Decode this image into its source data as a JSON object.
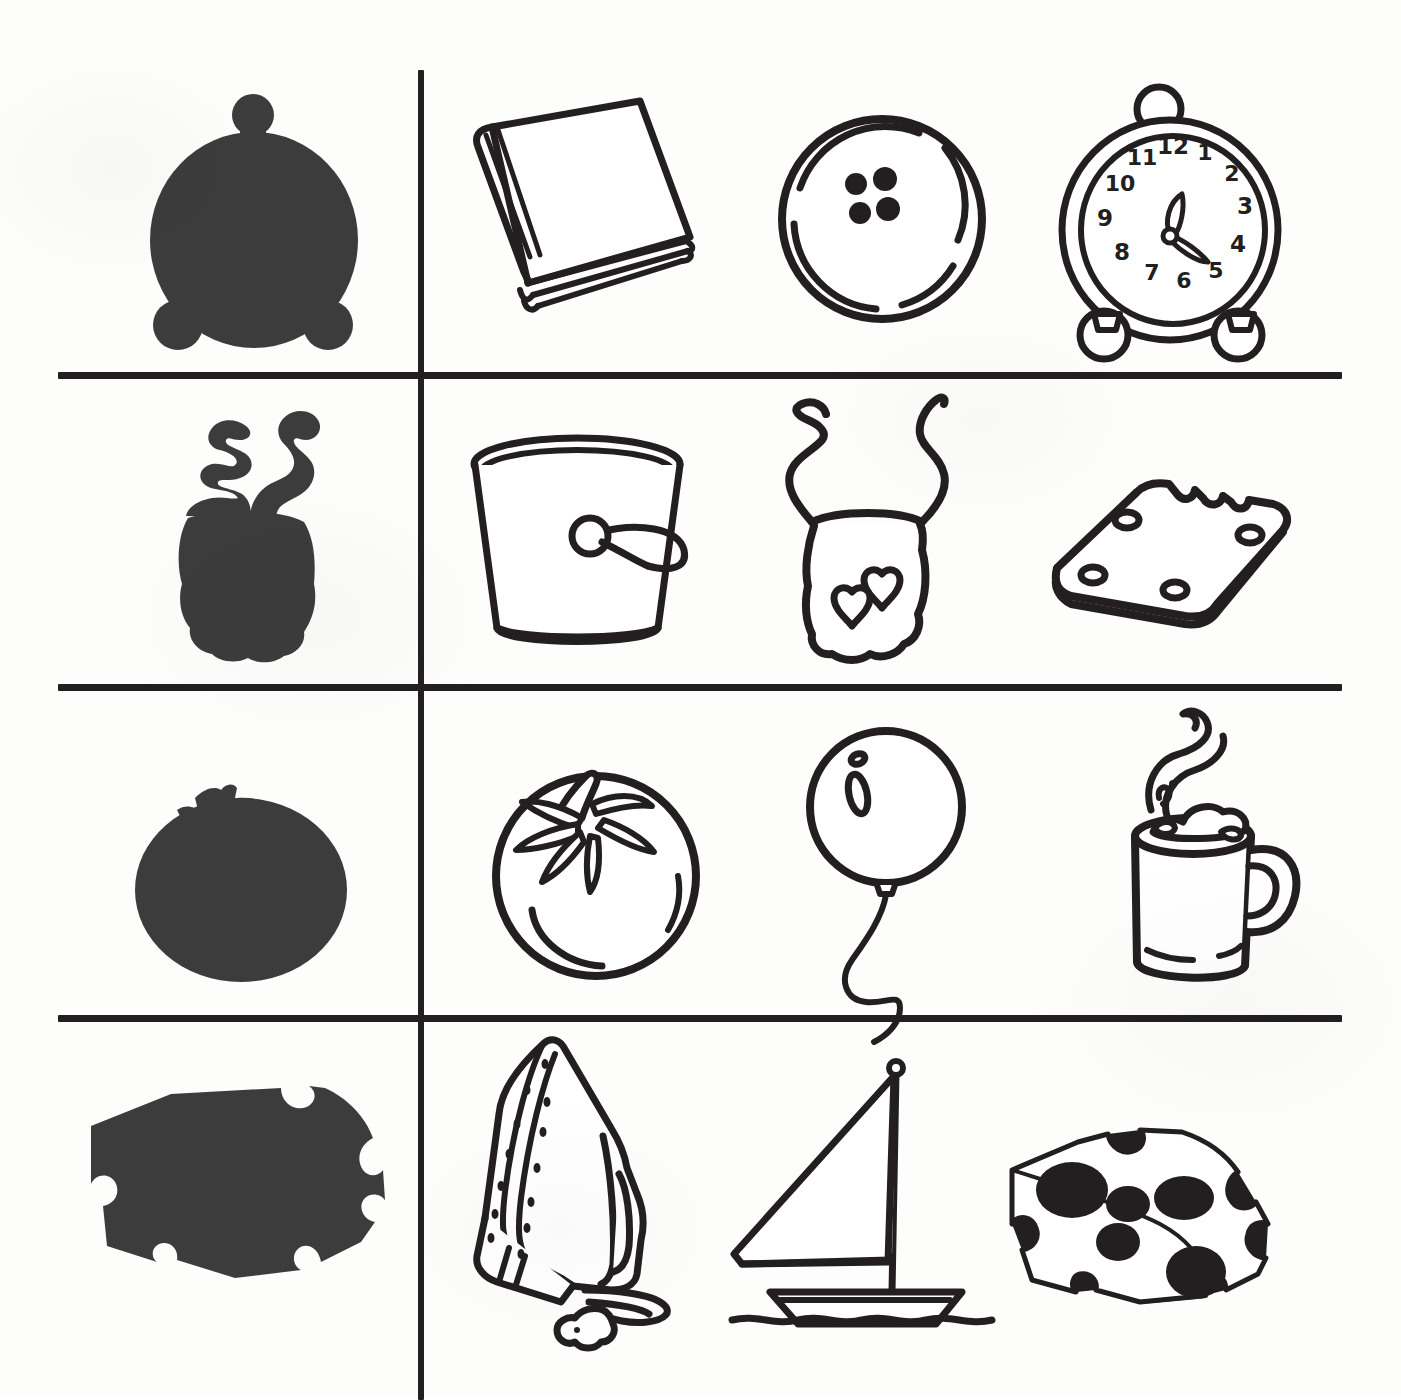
{
  "worksheet": {
    "title": "Shadow Matching Worksheet",
    "instruction": "",
    "layout": {
      "columns": 4,
      "rows": 4,
      "shadow_column_index": 0,
      "divider_color": "#231f20",
      "shadow_fill": "#3c3c3c",
      "outline_color": "#231f20",
      "background": "#ffffff"
    },
    "rows": [
      {
        "row_label": "row-1",
        "shadow": {
          "name": "alarm-clock-shadow",
          "object": "alarm clock"
        },
        "options": [
          {
            "name": "book",
            "label": "book",
            "is_match": false
          },
          {
            "name": "button",
            "label": "button",
            "is_match": false,
            "holes": 4
          },
          {
            "name": "alarm-clock",
            "label": "alarm clock",
            "is_match": true,
            "clock_numerals": [
              "12",
              "1",
              "2",
              "3",
              "4",
              "5",
              "6",
              "7",
              "8",
              "9",
              "10",
              "11"
            ],
            "hour_hand": "12",
            "minute_hand": "4"
          }
        ]
      },
      {
        "row_label": "row-2",
        "shadow": {
          "name": "bib-shadow",
          "object": "baby bib"
        },
        "options": [
          {
            "name": "bucket",
            "label": "bucket",
            "is_match": false
          },
          {
            "name": "bib",
            "label": "bib",
            "is_match": true,
            "decoration": "two hearts"
          },
          {
            "name": "cracker",
            "label": "cracker",
            "is_match": false,
            "detail": "bite taken out"
          }
        ]
      },
      {
        "row_label": "row-3",
        "shadow": {
          "name": "tomato-shadow",
          "object": "tomato"
        },
        "options": [
          {
            "name": "tomato",
            "label": "tomato",
            "is_match": true
          },
          {
            "name": "balloon",
            "label": "balloon",
            "is_match": false,
            "detail": "curly string"
          },
          {
            "name": "hot-cocoa-mug",
            "label": "mug of cocoa",
            "is_match": false,
            "detail": "steam and marshmallows"
          }
        ]
      },
      {
        "row_label": "row-4",
        "shadow": {
          "name": "cheese-shadow",
          "object": "cheese wedge"
        },
        "options": [
          {
            "name": "iron",
            "label": "iron",
            "is_match": false,
            "detail": "cord and plug"
          },
          {
            "name": "sailboat",
            "label": "sailboat",
            "is_match": false,
            "detail": "two sails on water"
          },
          {
            "name": "swiss-cheese",
            "label": "swiss cheese",
            "is_match": true,
            "detail": "holes"
          }
        ]
      }
    ]
  }
}
